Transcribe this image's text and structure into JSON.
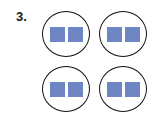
{
  "problem": {
    "number_label": "3.",
    "groups": [
      {
        "items": 2
      },
      {
        "items": 2
      },
      {
        "items": 2
      },
      {
        "items": 2
      }
    ],
    "item_color": "#6f86c4",
    "circle_stroke": "#111111"
  }
}
